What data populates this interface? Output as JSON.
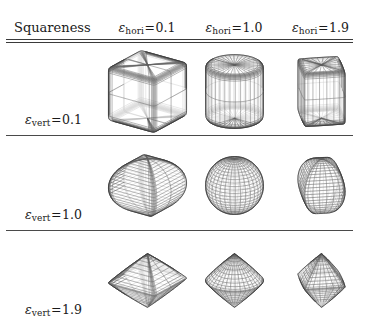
{
  "figure": {
    "corner_label": "Squareness",
    "column_headers": [
      {
        "symbol": "ε",
        "subscript": "hori",
        "relation": "=",
        "value": "0.1"
      },
      {
        "symbol": "ε",
        "subscript": "hori",
        "relation": "=",
        "value": "1.0"
      },
      {
        "symbol": "ε",
        "subscript": "hori",
        "relation": "=",
        "value": "1.9"
      }
    ],
    "row_headers": [
      {
        "symbol": "ε",
        "subscript": "vert",
        "relation": "=",
        "value": "0.1"
      },
      {
        "symbol": "ε",
        "subscript": "vert",
        "relation": "=",
        "value": "1.0"
      },
      {
        "symbol": "ε",
        "subscript": "vert",
        "relation": "=",
        "value": "1.9"
      }
    ],
    "line_color": "#3a3a3a",
    "wire_color": "#555555",
    "background": "#ffffff"
  },
  "chart_data": {
    "type": "table",
    "title": "Squareness",
    "xlabel": "ε_hori",
    "ylabel": "ε_vert",
    "x": [
      0.1,
      1.0,
      1.9
    ],
    "y": [
      0.1,
      1.0,
      1.9
    ],
    "cell_descriptions": [
      [
        "rounded cube",
        "cylinder",
        "cube with pinched concave top"
      ],
      [
        "barrel / lemon",
        "sphere",
        "rounded-square sphere"
      ],
      [
        "octahedron / double pyramid",
        "bicone",
        "pinched octahedron"
      ]
    ],
    "cells": [
      {
        "row": 0,
        "col": 0,
        "eps_vert": 0.1,
        "eps_hori": 0.1,
        "shape": "rounded cube"
      },
      {
        "row": 0,
        "col": 1,
        "eps_vert": 0.1,
        "eps_hori": 1.0,
        "shape": "cylinder"
      },
      {
        "row": 0,
        "col": 2,
        "eps_vert": 0.1,
        "eps_hori": 1.9,
        "shape": "cube with pinched concave top"
      },
      {
        "row": 1,
        "col": 0,
        "eps_vert": 1.0,
        "eps_hori": 0.1,
        "shape": "barrel / lemon"
      },
      {
        "row": 1,
        "col": 1,
        "eps_vert": 1.0,
        "eps_hori": 1.0,
        "shape": "sphere"
      },
      {
        "row": 1,
        "col": 2,
        "eps_vert": 1.0,
        "eps_hori": 1.9,
        "shape": "rounded-square sphere"
      },
      {
        "row": 2,
        "col": 0,
        "eps_vert": 1.9,
        "eps_hori": 0.1,
        "shape": "octahedron / double pyramid"
      },
      {
        "row": 2,
        "col": 1,
        "eps_vert": 1.9,
        "eps_hori": 1.0,
        "shape": "bicone"
      },
      {
        "row": 2,
        "col": 2,
        "eps_vert": 1.9,
        "eps_hori": 1.9,
        "shape": "pinched octahedron"
      }
    ]
  }
}
